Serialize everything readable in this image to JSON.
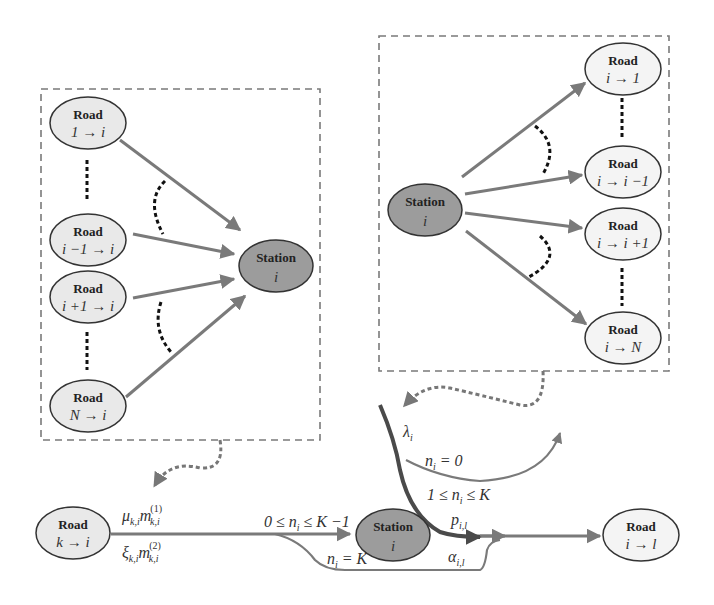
{
  "colors": {
    "road_fill": "#e9e9e9",
    "station_fill": "#9c9c9c",
    "edge": "#7a7a7a",
    "arrival_path": "#4a4a4a",
    "outline": "#333333",
    "dashed_box": "#7a7a7a"
  },
  "inflow_panel": {
    "roads": [
      {
        "title": "Road",
        "label": "1 → i"
      },
      {
        "title": "Road",
        "label": "i −1 → i"
      },
      {
        "title": "Road",
        "label": "i +1 → i"
      },
      {
        "title": "Road",
        "label": "N → i"
      }
    ],
    "station": {
      "title": "Station",
      "label": "i"
    }
  },
  "outflow_panel": {
    "station": {
      "title": "Station",
      "label": "i"
    },
    "roads": [
      {
        "title": "Road",
        "label": "i → 1"
      },
      {
        "title": "Road",
        "label": "i → i −1"
      },
      {
        "title": "Road",
        "label": "i → i +1"
      },
      {
        "title": "Road",
        "label": "i → N"
      }
    ]
  },
  "flow": {
    "source_road": {
      "title": "Road",
      "label": "k → i"
    },
    "station": {
      "title": "Station",
      "label": "i"
    },
    "target_road": {
      "title": "Road",
      "label": "i → l"
    },
    "labels": {
      "mu": "μ",
      "mu_sub": "k,i",
      "m1": "m",
      "m1_sup": "(1)",
      "m1_sub": "k,i",
      "xi": "ξ",
      "xi_sub": "k,i",
      "m2": "m",
      "m2_sup": "(2)",
      "m2_sub": "k,i",
      "cond_enter": "0 ≤ n",
      "cond_enter_sub": "i",
      "cond_enter_tail": " ≤ K −1",
      "cond_full": "n",
      "cond_full_sub": "i",
      "cond_full_tail": " = K",
      "lambda": "λ",
      "lambda_sub": "i",
      "cond_empty": "n",
      "cond_empty_sub": "i",
      "cond_empty_tail": " = 0",
      "cond_board": "1 ≤ n",
      "cond_board_sub": "i",
      "cond_board_tail": " ≤ K",
      "p": "p",
      "p_sub": "i,l",
      "alpha": "α",
      "alpha_sub": "i,l"
    }
  }
}
